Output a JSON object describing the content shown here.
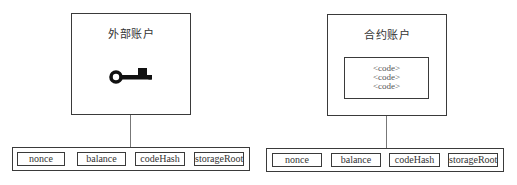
{
  "diagram": {
    "external_account": {
      "title": "外部账户",
      "icon": "key-icon",
      "fields": [
        "nonce",
        "balance",
        "codeHash",
        "storageRoot"
      ]
    },
    "contract_account": {
      "title": "合约账户",
      "code_lines": [
        "<code>",
        "<code>",
        "<code>"
      ],
      "fields": [
        "nonce",
        "balance",
        "codeHash",
        "storageRoot"
      ]
    },
    "colors": {
      "stroke": "#3a3a3a",
      "connector": "#777777",
      "icon": "#111111",
      "background": "#ffffff"
    }
  }
}
